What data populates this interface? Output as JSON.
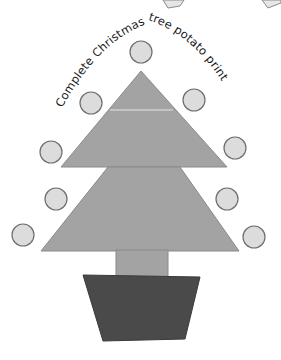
{
  "caption": {
    "text": "Complete Christmas tree potato print",
    "left_part": "Complete Christmas",
    "right_part": "tree potato print"
  },
  "colors": {
    "background": "#ffffff",
    "tree_fill": "#a3a3a3",
    "tree_stroke": "#7d7d7d",
    "pot_fill": "#4a4a4a",
    "ornament_fill": "#dcdcdc",
    "ornament_stroke": "#6e6e6e",
    "text": "#1a1a1a"
  },
  "ornaments": [
    {
      "cx": 141,
      "cy": 52,
      "r": 11
    },
    {
      "cx": 91,
      "cy": 103,
      "r": 11
    },
    {
      "cx": 194,
      "cy": 100,
      "r": 11
    },
    {
      "cx": 51,
      "cy": 152,
      "r": 11
    },
    {
      "cx": 235,
      "cy": 148,
      "r": 11
    },
    {
      "cx": 56,
      "cy": 199,
      "r": 11
    },
    {
      "cx": 227,
      "cy": 199,
      "r": 11
    },
    {
      "cx": 23,
      "cy": 235,
      "r": 11
    },
    {
      "cx": 254,
      "cy": 237,
      "r": 11
    }
  ]
}
